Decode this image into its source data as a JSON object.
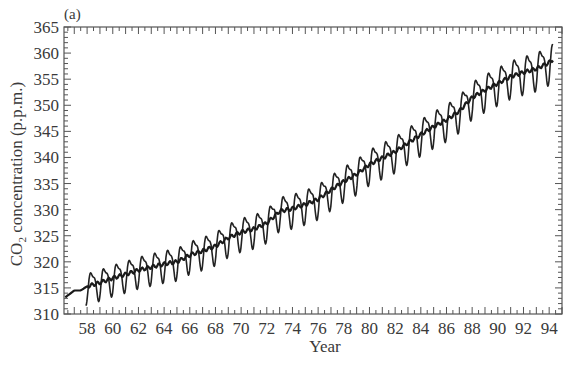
{
  "panel_label": "(a)",
  "chart_data": {
    "type": "line",
    "title": "",
    "panel": "(a)",
    "xlabel": "Year",
    "ylabel": "CO2 concentration (p.p.m.)",
    "ylabel_parts": {
      "pre": "CO",
      "sub": "2",
      "post": " concentration  (p.p.m.)"
    },
    "xlim": [
      56.2,
      95.0
    ],
    "ylim": [
      310,
      365
    ],
    "x_ticks": [
      58,
      60,
      62,
      64,
      66,
      68,
      70,
      72,
      74,
      76,
      78,
      80,
      82,
      84,
      86,
      88,
      90,
      92,
      94
    ],
    "y_ticks": [
      310,
      315,
      320,
      325,
      330,
      335,
      340,
      345,
      350,
      355,
      360,
      365
    ],
    "grid": false,
    "legend": null,
    "series": [
      {
        "name": "Monthly CO2 (seasonal cycle)",
        "style": "thin",
        "seasonal_amplitude_ppm": 3.2,
        "x_start": 57.9,
        "x_end": 94.3
      },
      {
        "name": "Annual mean trend",
        "style": "thick",
        "x": [
          56.3,
          57,
          57.5,
          58,
          59,
          60,
          61,
          62,
          63,
          64,
          65,
          66,
          67,
          68,
          69,
          70,
          71,
          72,
          73,
          74,
          75,
          76,
          77,
          78,
          79,
          80,
          81,
          82,
          83,
          84,
          85,
          86,
          87,
          88,
          89,
          90,
          91,
          92,
          93,
          94,
          94.3
        ],
        "values": [
          313.2,
          314.5,
          314.5,
          315.3,
          316.0,
          316.9,
          317.6,
          318.4,
          319.0,
          319.6,
          320.0,
          321.3,
          322.1,
          323.0,
          324.6,
          325.7,
          326.3,
          327.4,
          329.7,
          330.2,
          331.0,
          332.0,
          333.8,
          335.4,
          336.8,
          338.7,
          339.9,
          341.1,
          342.8,
          344.4,
          345.9,
          347.2,
          348.9,
          351.5,
          352.9,
          354.2,
          355.5,
          356.3,
          357.0,
          358.2,
          358.8
        ]
      }
    ]
  }
}
